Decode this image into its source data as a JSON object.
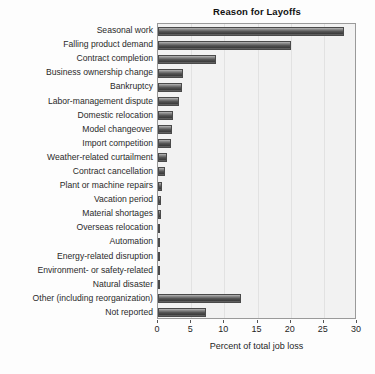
{
  "chart_data": {
    "type": "bar",
    "orientation": "horizontal",
    "title": "Reason for Layoffs",
    "xlabel": "Percent of total job loss",
    "ylabel": "",
    "xlim": [
      0,
      30
    ],
    "xticks": [
      0,
      5,
      10,
      15,
      20,
      25,
      30
    ],
    "grid": true,
    "legend": null,
    "categories": [
      "Seasonal work",
      "Falling product demand",
      "Contract completion",
      "Business ownership change",
      "Bankruptcy",
      "Labor-management dispute",
      "Domestic relocation",
      "Model changeover",
      "Import competition",
      "Weather-related curtailment",
      "Contract cancellation",
      "Plant or machine repairs",
      "Vacation period",
      "Material shortages",
      "Overseas relocation",
      "Automation",
      "Energy-related disruption",
      "Environment- or safety-related",
      "Natural disaster",
      "Other (including reorganization)",
      "Not reported"
    ],
    "values": [
      28.0,
      20.0,
      8.7,
      3.8,
      3.6,
      3.2,
      2.3,
      2.1,
      2.0,
      1.4,
      1.0,
      0.6,
      0.5,
      0.4,
      0.3,
      0.2,
      0.2,
      0.2,
      0.2,
      12.5,
      7.3
    ],
    "colors": {
      "bar": "#4a4a4a",
      "plot_background": "#f2f2f2",
      "gridline": "#e2e2e2",
      "axis": "#9a9a9a",
      "text": "#1f1f1f"
    }
  }
}
